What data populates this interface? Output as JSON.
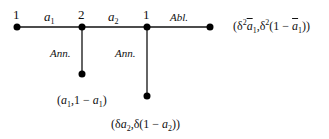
{
  "diagram": {
    "type": "game-tree",
    "nodes": [
      {
        "id": "n1",
        "player": "1",
        "x": 17,
        "y": 27
      },
      {
        "id": "n2",
        "player": "2",
        "x": 82,
        "y": 27
      },
      {
        "id": "n3",
        "player": "1",
        "x": 147,
        "y": 27
      },
      {
        "id": "t1",
        "x": 82,
        "y": 74,
        "payoff": "(a1, 1 − a1)"
      },
      {
        "id": "t2",
        "x": 147,
        "y": 96,
        "payoff": "(δa2, δ(1 − a2))"
      },
      {
        "id": "t3",
        "x": 210,
        "y": 27,
        "payoff": "(δ²ā1, δ²(1 − ā1))"
      }
    ],
    "edges": [
      {
        "from": "n1",
        "to": "n2",
        "label": "a1"
      },
      {
        "from": "n2",
        "to": "n3",
        "label": "a2"
      },
      {
        "from": "n3",
        "to": "t3",
        "label": "Abl."
      },
      {
        "from": "n2",
        "to": "t1",
        "label": "Ann."
      },
      {
        "from": "n3",
        "to": "t2",
        "label": "Ann."
      }
    ],
    "labels": {
      "player_1a": "1",
      "player_2": "2",
      "player_1b": "1",
      "offer_a1_base": "a",
      "offer_a1_sub": "1",
      "offer_a2_base": "a",
      "offer_a2_sub": "2",
      "action_reject": "Abl.",
      "action_accept_1": "Ann.",
      "action_accept_2": "Ann."
    },
    "payoffs": {
      "t1": {
        "open": "(",
        "a": "a",
        "a_sub": "1",
        "mid": ",1 − ",
        "b": "a",
        "b_sub": "1",
        "close": ")"
      },
      "t2": {
        "open": "(δ",
        "a": "a",
        "a_sub": "2",
        "mid": ",δ(1 − ",
        "b": "a",
        "b_sub": "2",
        "close": "))"
      },
      "t3": {
        "open": "(δ",
        "sup1": "2",
        "a": "a",
        "a_sub": "1",
        "mid1": ",δ",
        "sup2": "2",
        "mid2": "(1 − ",
        "b": "a",
        "b_sub": "1",
        "close": "))"
      }
    },
    "colors": {
      "line": "#111111",
      "node": "#000000",
      "background": "#ffffff"
    }
  }
}
